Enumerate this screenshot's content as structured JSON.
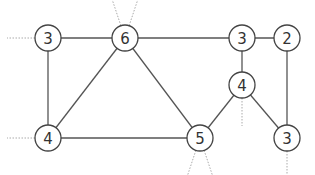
{
  "graph": {
    "colors": {
      "edge": "#555555",
      "node_stroke": "#444444",
      "stub": "#aaaaaa",
      "label": "#333333"
    },
    "nodes": [
      {
        "id": "n1",
        "label": "3",
        "x": 48,
        "y": 38
      },
      {
        "id": "n2",
        "label": "6",
        "x": 125,
        "y": 38
      },
      {
        "id": "n3",
        "label": "3",
        "x": 242,
        "y": 38
      },
      {
        "id": "n4",
        "label": "2",
        "x": 287,
        "y": 38
      },
      {
        "id": "n5",
        "label": "4",
        "x": 242,
        "y": 85
      },
      {
        "id": "n6",
        "label": "4",
        "x": 48,
        "y": 138
      },
      {
        "id": "n7",
        "label": "5",
        "x": 200,
        "y": 138
      },
      {
        "id": "n8",
        "label": "3",
        "x": 287,
        "y": 138
      }
    ],
    "edges": [
      [
        "n1",
        "n2"
      ],
      [
        "n2",
        "n3"
      ],
      [
        "n3",
        "n4"
      ],
      [
        "n1",
        "n6"
      ],
      [
        "n2",
        "n6"
      ],
      [
        "n2",
        "n7"
      ],
      [
        "n6",
        "n7"
      ],
      [
        "n3",
        "n5"
      ],
      [
        "n5",
        "n7"
      ],
      [
        "n5",
        "n8"
      ],
      [
        "n4",
        "n8"
      ]
    ],
    "stubs": [
      {
        "from": "n1",
        "dx": -28,
        "dy": 0
      },
      {
        "from": "n6",
        "dx": -28,
        "dy": 0
      },
      {
        "from": "n2",
        "dx": -10,
        "dy": -30
      },
      {
        "from": "n2",
        "dx": 10,
        "dy": -30
      },
      {
        "from": "n7",
        "dx": -10,
        "dy": 30
      },
      {
        "from": "n7",
        "dx": 10,
        "dy": 30
      },
      {
        "from": "n5",
        "dx": 0,
        "dy": 28
      },
      {
        "from": "n8",
        "dx": 0,
        "dy": 28
      }
    ]
  }
}
